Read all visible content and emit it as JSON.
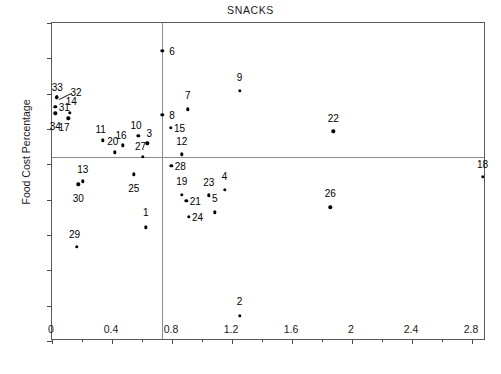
{
  "chart_data": {
    "type": "scatter",
    "title": "SNACKS",
    "xlabel": "",
    "ylabel": "Food Cost Percentage",
    "xlim": [
      0,
      2.893
    ],
    "ylim": [
      10,
      55
    ],
    "xticks": [
      0,
      0.4,
      0.8,
      1.2,
      1.6,
      2,
      2.4,
      2.8
    ],
    "xticklabels": [
      "0",
      "0.4",
      "0.8",
      "1.2",
      "1.6",
      "2",
      "2.4",
      "2.8"
    ],
    "xminorticks": [
      0.2,
      0.6,
      1.0,
      1.4,
      1.8,
      2.2,
      2.6
    ],
    "yticks": [
      10,
      15,
      20,
      25,
      30,
      35,
      40,
      45,
      50,
      55
    ],
    "yticklabels": [
      "10",
      "15",
      "20",
      "25",
      "30",
      "35",
      "40",
      "45",
      "50",
      "55"
    ],
    "grid": false,
    "reference_lines": {
      "vertical_x": 0.735,
      "horizontal_y": 36.1
    },
    "point_label_position": "offset",
    "points": [
      {
        "label": "1",
        "x": 0.625,
        "y": 26.1,
        "lx": 0.625,
        "ly": 28.2
      },
      {
        "label": "2",
        "x": 1.25,
        "y": 13.6,
        "lx": 1.25,
        "ly": 15.7
      },
      {
        "label": "3",
        "x": 0.635,
        "y": 38.0,
        "lx": 0.648,
        "ly": 39.5
      },
      {
        "label": "4",
        "x": 1.15,
        "y": 31.4,
        "lx": 1.15,
        "ly": 33.4
      },
      {
        "label": "5",
        "x": 1.085,
        "y": 28.2,
        "lx": 1.085,
        "ly": 30.2
      },
      {
        "label": "6",
        "x": 0.735,
        "y": 51.1,
        "lx": 0.8,
        "ly": 51.1
      },
      {
        "label": "7",
        "x": 0.905,
        "y": 42.8,
        "lx": 0.905,
        "ly": 44.8
      },
      {
        "label": "8",
        "x": 0.735,
        "y": 42.0,
        "lx": 0.8,
        "ly": 42.0
      },
      {
        "label": "9",
        "x": 1.25,
        "y": 45.4,
        "lx": 1.25,
        "ly": 47.4
      },
      {
        "label": "10",
        "x": 0.575,
        "y": 39.0,
        "lx": 0.56,
        "ly": 40.6
      },
      {
        "label": "11",
        "x": 0.34,
        "y": 38.4,
        "lx": 0.325,
        "ly": 40.0
      },
      {
        "label": "12",
        "x": 0.865,
        "y": 36.4,
        "lx": 0.865,
        "ly": 38.3
      },
      {
        "label": "13",
        "x": 0.205,
        "y": 32.6,
        "lx": 0.205,
        "ly": 34.4
      },
      {
        "label": "14",
        "x": 0.117,
        "y": 42.3,
        "lx": 0.128,
        "ly": 43.9
      },
      {
        "label": "15",
        "x": 0.79,
        "y": 40.2,
        "lx": 0.85,
        "ly": 40.2
      },
      {
        "label": "16",
        "x": 0.47,
        "y": 37.7,
        "lx": 0.46,
        "ly": 39.1
      },
      {
        "label": "17",
        "x": 0.108,
        "y": 41.5,
        "lx": 0.08,
        "ly": 40.3
      },
      {
        "label": "18",
        "x": 2.87,
        "y": 33.2,
        "lx": 2.87,
        "ly": 35.1
      },
      {
        "label": "19",
        "x": 0.865,
        "y": 30.7,
        "lx": 0.865,
        "ly": 32.6
      },
      {
        "label": "20",
        "x": 0.42,
        "y": 36.7,
        "lx": 0.405,
        "ly": 38.3
      },
      {
        "label": "21",
        "x": 0.895,
        "y": 29.8,
        "lx": 0.955,
        "ly": 29.8
      },
      {
        "label": "22",
        "x": 1.875,
        "y": 39.7,
        "lx": 1.875,
        "ly": 41.6
      },
      {
        "label": "23",
        "x": 1.045,
        "y": 30.6,
        "lx": 1.045,
        "ly": 32.5
      },
      {
        "label": "24",
        "x": 0.91,
        "y": 27.6,
        "lx": 0.97,
        "ly": 27.6
      },
      {
        "label": "25",
        "x": 0.545,
        "y": 33.6,
        "lx": 0.545,
        "ly": 31.6
      },
      {
        "label": "26",
        "x": 1.855,
        "y": 28.9,
        "lx": 1.855,
        "ly": 30.9
      },
      {
        "label": "27",
        "x": 0.605,
        "y": 36.1,
        "lx": 0.59,
        "ly": 37.6
      },
      {
        "label": "28",
        "x": 0.795,
        "y": 34.8,
        "lx": 0.855,
        "ly": 34.8
      },
      {
        "label": "29",
        "x": 0.165,
        "y": 23.3,
        "lx": 0.15,
        "ly": 25.2
      },
      {
        "label": "30",
        "x": 0.175,
        "y": 32.2,
        "lx": 0.175,
        "ly": 30.3
      },
      {
        "label": "31",
        "x": 0.022,
        "y": 43.1,
        "lx": 0.082,
        "ly": 43.1
      },
      {
        "label": "32",
        "x": 0.03,
        "y": 44.5,
        "lx": 0.16,
        "ly": 45.3
      },
      {
        "label": "33",
        "x": 0.03,
        "y": 44.5,
        "lx": 0.035,
        "ly": 46.0
      },
      {
        "label": "34",
        "x": 0.022,
        "y": 42.2,
        "lx": 0.022,
        "ly": 40.4
      }
    ],
    "leaders": [
      {
        "from_x": 0.045,
        "from_y": 44.2,
        "to_x": 0.13,
        "to_y": 45.1
      }
    ]
  }
}
